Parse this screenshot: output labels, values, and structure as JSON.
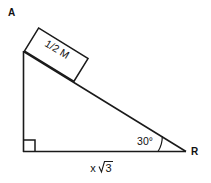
{
  "diagram": {
    "title_label": "A",
    "vertex_labels": {
      "top": "A",
      "right": "R"
    },
    "block": {
      "label": "1/2 M",
      "name": "half-mass-block"
    },
    "angle": {
      "value": "30°",
      "at_vertex": "R"
    },
    "base": {
      "label": "x √3",
      "label_x": "x",
      "label_radicand": "3"
    },
    "right_angle": {
      "marker": "square",
      "at_vertex": "bottom-left"
    },
    "colors": {
      "background": "#ffffff",
      "stroke": "#1a1a1a",
      "text": "#111111"
    }
  }
}
